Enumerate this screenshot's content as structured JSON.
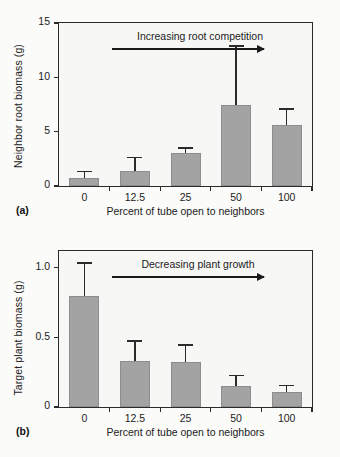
{
  "figure": {
    "background_color": "#fbfbfa",
    "bar_color": "#a3a3a3",
    "axis_color": "#2b2b2b"
  },
  "panels": [
    {
      "letter": "(a)",
      "xcaption": "Percent of tube open to neighbors",
      "annotation": "Increasing root competition",
      "chart_data": {
        "type": "bar",
        "title": "",
        "xlabel": "Percent of tube open to neighbors",
        "ylabel": "Neighbor root biomass (g)",
        "categories": [
          "0",
          "12.5",
          "25",
          "50",
          "100"
        ],
        "values": [
          0.75,
          1.4,
          3.0,
          7.5,
          5.6
        ],
        "errors_upper": [
          1.25,
          2.55,
          3.4,
          12.8,
          7.0
        ],
        "yticks": [
          0,
          5,
          10,
          15
        ],
        "ytick_labels": [
          "0",
          "5",
          "10",
          "15"
        ],
        "ylim": [
          0,
          15
        ],
        "grid": false,
        "legend": "none",
        "annotation": "Increasing root competition"
      }
    },
    {
      "letter": "(b)",
      "xcaption": "Percent of tube open to neighbors",
      "annotation": "Decreasing plant growth",
      "chart_data": {
        "type": "bar",
        "title": "",
        "xlabel": "Percent of tube open to neighbors",
        "ylabel": "Target plant biomass (g)",
        "categories": [
          "0",
          "12.5",
          "25",
          "50",
          "100"
        ],
        "values": [
          0.8,
          0.33,
          0.32,
          0.15,
          0.11
        ],
        "errors_upper": [
          1.03,
          0.47,
          0.44,
          0.22,
          0.15
        ],
        "yticks": [
          0,
          0.5,
          1.0
        ],
        "ytick_labels": [
          "0",
          "0.5",
          "1.0"
        ],
        "ylim": [
          0,
          1.12
        ],
        "grid": false,
        "legend": "none",
        "annotation": "Decreasing plant growth"
      }
    }
  ]
}
